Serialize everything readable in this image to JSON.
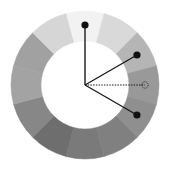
{
  "diagram": {
    "type": "color-wheel",
    "center": [
      85,
      85
    ],
    "outer_radius": 74,
    "inner_radius": 44,
    "segment_count": 12,
    "segments": [
      {
        "index": 0,
        "position": "top",
        "color": "#f2f2f2"
      },
      {
        "index": 1,
        "position": "top-right",
        "color": "#d9d9d9"
      },
      {
        "index": 2,
        "position": "right-upper",
        "color": "#b5b5b5"
      },
      {
        "index": 3,
        "position": "right",
        "color": "#999999"
      },
      {
        "index": 4,
        "position": "right-lower",
        "color": "#8f8f8f"
      },
      {
        "index": 5,
        "position": "bottom-right",
        "color": "#808080"
      },
      {
        "index": 6,
        "position": "bottom",
        "color": "#7a7a7a"
      },
      {
        "index": 7,
        "position": "bottom-left",
        "color": "#6e6e6e"
      },
      {
        "index": 8,
        "position": "left-lower",
        "color": "#878787"
      },
      {
        "index": 9,
        "position": "left",
        "color": "#a3a3a3"
      },
      {
        "index": 10,
        "position": "left-upper",
        "color": "#a1a1a1"
      },
      {
        "index": 11,
        "position": "top-left",
        "color": "#d6d6d6"
      }
    ],
    "markers": [
      {
        "name": "base-color",
        "angle_deg": 270,
        "style": "filled",
        "line": "solid"
      },
      {
        "name": "split-complement-1",
        "angle_deg": 330,
        "style": "filled",
        "line": "solid"
      },
      {
        "name": "complement",
        "angle_deg": 0,
        "style": "hollow-dashed",
        "line": "dotted"
      },
      {
        "name": "split-complement-2",
        "angle_deg": 30,
        "style": "filled",
        "line": "solid"
      }
    ],
    "marker_radius_track": 60,
    "line_color": "#1a1a1a"
  }
}
